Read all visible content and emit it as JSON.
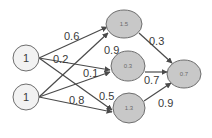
{
  "diagram": {
    "type": "neural-network",
    "colors": {
      "input_fill": "#f2f2f2",
      "hidden_fill": "#c8c8c8",
      "stroke": "#6e6e6e",
      "edge": "#4a4a4a"
    },
    "inputs": [
      {
        "id": "i1",
        "label": "1"
      },
      {
        "id": "i2",
        "label": "1"
      }
    ],
    "hidden": [
      {
        "id": "h1",
        "label": "1.5"
      },
      {
        "id": "h2",
        "label": "0.3"
      },
      {
        "id": "h3",
        "label": "1.3"
      }
    ],
    "output": {
      "id": "o1",
      "label": "0.7"
    },
    "edges": [
      {
        "from": "i1",
        "to": "h1",
        "weight": "0.6"
      },
      {
        "from": "i1",
        "to": "h2",
        "weight": "0.2"
      },
      {
        "from": "i1",
        "to": "h3",
        "weight": "0.5"
      },
      {
        "from": "i2",
        "to": "h1",
        "weight": "0.9"
      },
      {
        "from": "i2",
        "to": "h2",
        "weight": "0.1"
      },
      {
        "from": "i2",
        "to": "h3",
        "weight": "0.8"
      },
      {
        "from": "h1",
        "to": "o1",
        "weight": "0.3"
      },
      {
        "from": "h2",
        "to": "o1",
        "weight": "0.7"
      },
      {
        "from": "h3",
        "to": "o1",
        "weight": "0.9"
      }
    ]
  }
}
